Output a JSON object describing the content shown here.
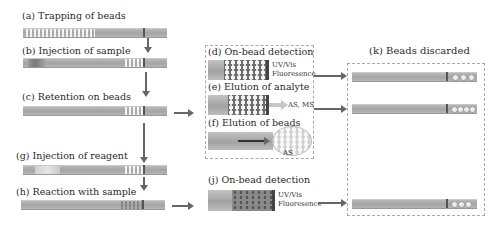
{
  "steps": {
    "a": {
      "label": "(a) Trapping of beads"
    },
    "b": {
      "label": "(b) Injection of sample"
    },
    "c": {
      "label": "(c) Retention on beads"
    },
    "d": {
      "label": "(d) On-bead detection",
      "detector": [
        "UV/Vis",
        "Fluoresence"
      ]
    },
    "e": {
      "label": "(e) Elution of analyte",
      "detector": "AS, MS"
    },
    "f": {
      "label": "(f) Elution of beads",
      "detector": "AS"
    },
    "g": {
      "label": "(g) Injection of reagent"
    },
    "h": {
      "label": "(h) Reaction with sample"
    },
    "j": {
      "label": "(j) On-bead detection",
      "detector": [
        "UV/Vis",
        "Fluoresence"
      ]
    },
    "k": {
      "label": "(k) Beads discarded"
    }
  },
  "colors": {
    "tube": "#aaaaaa",
    "arrow": "#666666",
    "dashed_border": "#aaaaaa",
    "text": "#2a2a2a"
  }
}
